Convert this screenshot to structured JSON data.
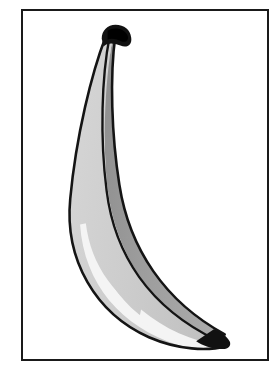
{
  "image": {
    "title": "Banana clip art illustration",
    "subject": "banana",
    "style": "grayscale line-art clip art",
    "background_color": "#ffffff",
    "canvas_width": 280,
    "canvas_height": 380
  },
  "frame": {
    "name": "picture-border",
    "color": "#1a1a1a",
    "border_width_px": 2,
    "x": 21,
    "y": 9,
    "width": 248,
    "height": 352,
    "fill": "#ffffff"
  },
  "banana": {
    "name": "banana-illustration",
    "outline_color": "#141414",
    "outline_width_px": 2.6,
    "light_face_color": "#cccccc",
    "dark_face_color": "#9a9a9a",
    "highlight_color": "#f4f4f4",
    "stem_color": "#111111",
    "tip_color": "#111111",
    "ridge_color": "#141414",
    "orientation": "crescent curving from upper-left down to lower-right",
    "top_tip": {
      "x": 108,
      "y": 31
    },
    "bottom_tip": {
      "x": 223,
      "y": 334
    },
    "leftmost": {
      "x": 62,
      "y": 204
    },
    "paths": {
      "outer_edge": "M 104 34 C 86 62, 68 128, 64 196 C 61 252, 92 302, 146 326 C 176 339, 206 341, 222 334",
      "inner_edge": "M 114 33 C 110 72, 116 128, 128 176 C 144 238, 176 290, 220 320",
      "ridge_line": "M 108 44 C 96 80, 88 140, 92 196 C 97 254, 132 306, 186 326",
      "highlight_edge": "M 104 238 C 116 282, 152 316, 200 330"
    }
  },
  "parts": [
    {
      "name": "banana-stem",
      "label": "stem",
      "color": "#111111"
    },
    {
      "name": "banana-light-face",
      "label": "lit outer face",
      "color": "#cccccc"
    },
    {
      "name": "banana-dark-face",
      "label": "shaded inner face",
      "color": "#9a9a9a"
    },
    {
      "name": "banana-highlight",
      "label": "bottom highlight",
      "color": "#f4f4f4"
    },
    {
      "name": "banana-tip",
      "label": "blossom tip",
      "color": "#111111"
    }
  ]
}
